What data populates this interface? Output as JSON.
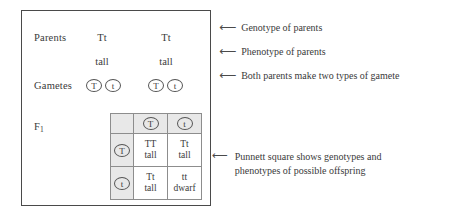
{
  "diagram": {
    "colors": {
      "text": "#3a3a3a",
      "outer_border": "#4a4a4a",
      "grid_border": "#8d8d8d",
      "header_shade": "#e8e8e8",
      "background": "#ffffff"
    },
    "rows": {
      "parents": {
        "label": "Parents",
        "parent_a": "Tt",
        "parent_b": "Tt"
      },
      "phenotype": {
        "parent_a": "tall",
        "parent_b": "tall"
      },
      "gametes": {
        "label": "Gametes",
        "parent_a": [
          "T",
          "t"
        ],
        "parent_b": [
          "T",
          "t"
        ]
      },
      "f1": {
        "label": "F",
        "label_subscript": "1"
      }
    },
    "punnett": {
      "corner": "",
      "column_headers": [
        "T",
        "t"
      ],
      "row_headers": [
        "T",
        "t"
      ],
      "cells": [
        [
          {
            "genotype": "TT",
            "phenotype": "tall"
          },
          {
            "genotype": "Tt",
            "phenotype": "tall"
          }
        ],
        [
          {
            "genotype": "Tt",
            "phenotype": "tall"
          },
          {
            "genotype": "tt",
            "phenotype": "dwarf"
          }
        ]
      ]
    },
    "annotations": {
      "genotype": {
        "arrow": "⟵",
        "text": "Genotype of parents"
      },
      "phenotype": {
        "arrow": "⟵",
        "text": "Phenotype of parents"
      },
      "gametes": {
        "arrow": "⟵",
        "text": "Both parents make two types of gamete"
      },
      "punnett": {
        "arrow": "⟵",
        "line1": "Punnett square shows genotypes and",
        "line2": "phenotypes of possible offspring"
      }
    }
  }
}
